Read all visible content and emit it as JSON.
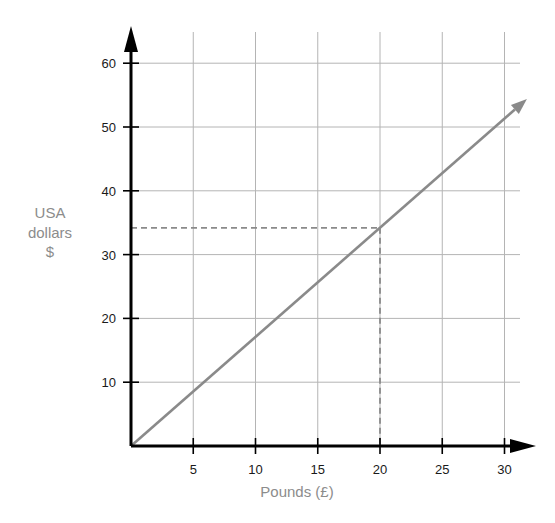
{
  "chart_data": {
    "type": "line",
    "title": "",
    "xlabel": "Pounds (£)",
    "ylabel_lines": [
      "USA",
      "dollars",
      "$"
    ],
    "xlim": [
      0,
      32
    ],
    "ylim": [
      0,
      65
    ],
    "x_ticks": [
      5,
      10,
      15,
      20,
      25,
      30
    ],
    "x_tick_labels": [
      "5",
      "10",
      "15",
      "20",
      "25",
      "30"
    ],
    "y_ticks": [
      10,
      20,
      30,
      40,
      50,
      60
    ],
    "y_tick_labels": [
      "10",
      "20",
      "30",
      "40",
      "50",
      "60"
    ],
    "grid": true,
    "legend": null,
    "series": [
      {
        "name": "Conversion line (pounds to dollars)",
        "x": [
          0,
          31.8
        ],
        "y": [
          0,
          54.4
        ],
        "rate": 1.71,
        "color": "#8a8a8a",
        "arrow_end": true
      }
    ],
    "annotations": [
      {
        "type": "dashed-guide",
        "description": "Reading £20 → approx $34.2",
        "x": 20,
        "y": 34.2,
        "color": "#8a8a8a"
      }
    ]
  },
  "colors": {
    "axis": "#000000",
    "grid": "#b4b4b4",
    "line": "#8a8a8a",
    "guide": "#8a8a8a",
    "tick_text": "#1a1a1a",
    "axis_title": "#8c8c8c"
  }
}
